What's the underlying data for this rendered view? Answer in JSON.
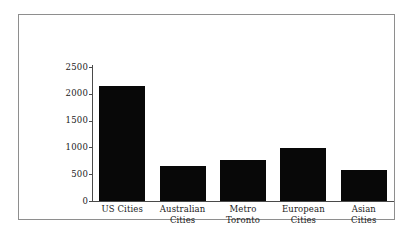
{
  "chart_data": {
    "type": "bar",
    "title": "",
    "subtitle": "",
    "xlabel": "",
    "ylabel": "",
    "categories": [
      "US Cities",
      "Australian Cities",
      "Metro Toronto",
      "European Cities",
      "Asian Cities"
    ],
    "category_lines": [
      [
        "US Cities"
      ],
      [
        "Australian",
        "Cities"
      ],
      [
        "Metro",
        "Toronto"
      ],
      [
        "European",
        "Cities"
      ],
      [
        "Asian",
        "Cities"
      ]
    ],
    "values": [
      2150,
      650,
      760,
      980,
      570
    ],
    "ylim": [
      0,
      2500
    ],
    "yticks": [
      0,
      500,
      1000,
      1500,
      2000,
      2500
    ],
    "ytick_labels": [
      "0",
      "500",
      "1000",
      "1500",
      "2000",
      "2500"
    ],
    "grid": false,
    "legend": false,
    "legend_position": "none",
    "bar_color": "#080808",
    "axis_color": "#4a4a4a",
    "frame_color": "#8e8e8e",
    "background_color": "#ffffff"
  }
}
